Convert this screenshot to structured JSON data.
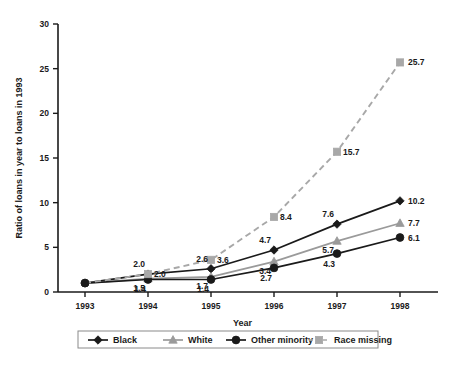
{
  "chart_data": {
    "type": "line",
    "title": "",
    "xlabel": "Year",
    "ylabel": "Ratio of loans in year to loans in 1993",
    "categories": [
      "1993",
      "1994",
      "1995",
      "1996",
      "1997",
      "1998"
    ],
    "x": [
      1993,
      1994,
      1995,
      1996,
      1997,
      1998
    ],
    "xlim": [
      1993,
      1998
    ],
    "ylim": [
      0,
      30
    ],
    "yticks": [
      0,
      5,
      10,
      15,
      20,
      25,
      30
    ],
    "xticks": [
      "1993",
      "1994",
      "1995",
      "1996",
      "1997",
      "1998"
    ],
    "grid": false,
    "legend_position": "bottom",
    "series": [
      {
        "name": "Black",
        "color": "#1a1a1a",
        "marker": "diamond",
        "linestyle": "solid",
        "values": [
          1.0,
          2.0,
          2.6,
          4.7,
          7.6,
          10.2
        ],
        "labels": [
          "",
          "2.0",
          "2.6",
          "4.7",
          "7.6",
          "10.2"
        ]
      },
      {
        "name": "White",
        "color": "#9a9a9a",
        "marker": "triangle",
        "linestyle": "solid",
        "values": [
          1.0,
          1.5,
          1.7,
          3.4,
          5.7,
          7.7
        ],
        "labels": [
          "",
          "1.5",
          "1.7",
          "3.4",
          "5.7",
          "7.7"
        ]
      },
      {
        "name": "Other minority",
        "color": "#1a1a1a",
        "marker": "circle",
        "linestyle": "solid",
        "values": [
          1.0,
          1.4,
          1.4,
          2.7,
          4.3,
          6.1
        ],
        "labels": [
          "",
          "1.4",
          "1.4",
          "2.7",
          "4.3",
          "6.1"
        ]
      },
      {
        "name": "Race missing",
        "color": "#a8a8a8",
        "marker": "square",
        "linestyle": "dashed",
        "values": [
          1.0,
          2.0,
          3.6,
          8.4,
          15.7,
          25.7
        ],
        "labels": [
          "",
          "2.0",
          "3.6",
          "8.4",
          "15.7",
          "25.7"
        ]
      }
    ]
  },
  "legend": {
    "items": [
      {
        "label": "Black"
      },
      {
        "label": "White"
      },
      {
        "label": "Other minority"
      },
      {
        "label": "Race missing"
      }
    ]
  },
  "axes": {
    "y_title": "Ratio of loans in year to loans in 1993",
    "x_title": "Year"
  }
}
